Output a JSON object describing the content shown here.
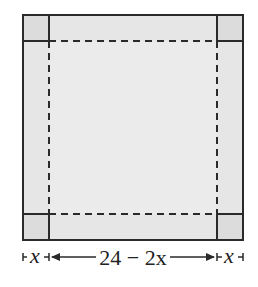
{
  "diagram": {
    "colors": {
      "sheet_fill": "#e6e6e6",
      "corner_fill": "#dcdcdc",
      "line": "#2a2a2a",
      "background": "#ffffff"
    },
    "labels": {
      "left_x": "x",
      "middle": "24 − 2x",
      "right_x": "x"
    }
  }
}
